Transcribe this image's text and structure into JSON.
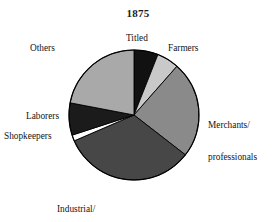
{
  "chart": {
    "title": "1875",
    "background_color": "#ffffff",
    "outline_color": "#000000"
  },
  "labels": {
    "titled": "Titled",
    "farmers": "Farmers",
    "merchants_line1": "Merchants/",
    "merchants_line2": "professionals",
    "industrial_line1": "Industrial/",
    "industrial_line2": "building trades",
    "shopkeepers": "Shopkeepers",
    "laborers": "Laborers",
    "others": "Others"
  },
  "chart_data": {
    "type": "pie",
    "title": "1875",
    "xlabel": "",
    "ylabel": "",
    "start_angle_deg": 0,
    "direction": "clockwise",
    "center": [
      134,
      115
    ],
    "radius": 65,
    "legend_position": "outside-labels",
    "grid": false,
    "categories": [
      "Titled",
      "Farmers",
      "Merchants/professionals",
      "Industrial/building trades",
      "Shopkeepers",
      "Laborers",
      "Others"
    ],
    "values": [
      6,
      5.5,
      24,
      33,
      1.5,
      8,
      22
    ],
    "unit": "percent",
    "slices": [
      {
        "label": "Titled",
        "value": 6,
        "start_deg": 0,
        "end_deg": 21.6,
        "color": "#111111"
      },
      {
        "label": "Farmers",
        "value": 5.5,
        "start_deg": 21.6,
        "end_deg": 41.4,
        "color": "#c9c9c9"
      },
      {
        "label": "Merchants/professionals",
        "value": 24,
        "start_deg": 41.4,
        "end_deg": 127.8,
        "color": "#8a8a8a"
      },
      {
        "label": "Industrial/building trades",
        "value": 33,
        "start_deg": 127.8,
        "end_deg": 246.6,
        "color": "#474747"
      },
      {
        "label": "Shopkeepers",
        "value": 1.5,
        "start_deg": 246.6,
        "end_deg": 252.0,
        "color": "#ffffff"
      },
      {
        "label": "Laborers",
        "value": 8,
        "start_deg": 252.0,
        "end_deg": 280.8,
        "color": "#1b1b1b"
      },
      {
        "label": "Others",
        "value": 22,
        "start_deg": 280.8,
        "end_deg": 360.0,
        "color": "#a9a9a9"
      }
    ]
  }
}
